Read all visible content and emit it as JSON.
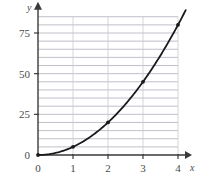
{
  "chart_data": {
    "type": "line",
    "title": "",
    "subtitle": "",
    "xlabel": "x",
    "ylabel": "y",
    "xlim": [
      0,
      4
    ],
    "ylim": [
      0,
      85
    ],
    "x_ticks": [
      0,
      1,
      2,
      3,
      4
    ],
    "x_tick_labels": [
      "0",
      "1",
      "2",
      "3",
      "4"
    ],
    "y_ticks": [
      0,
      25,
      50,
      75
    ],
    "y_tick_labels": [
      "0",
      "25",
      "50",
      "75"
    ],
    "grid": {
      "horizontal": true,
      "horizontal_step": 5,
      "horizontal_values": [
        5,
        10,
        15,
        20,
        25,
        30,
        35,
        40,
        45,
        50,
        55,
        60,
        65,
        70,
        75,
        80,
        85
      ],
      "vertical": true,
      "vertical_values": [
        1,
        2,
        3,
        4
      ]
    },
    "legend": null,
    "series": [
      {
        "name": "y = 5x²",
        "x": [
          0,
          1,
          2,
          3,
          4
        ],
        "values": [
          0,
          5,
          20,
          45,
          80
        ],
        "marked_points": [
          {
            "x": 0,
            "y": 0,
            "label": "0"
          },
          {
            "x": 1,
            "y": 5,
            "label": "5"
          },
          {
            "x": 2,
            "y": 20,
            "label": "20"
          },
          {
            "x": 3,
            "y": 45,
            "label": "45"
          },
          {
            "x": 4,
            "y": 80,
            "label": "80"
          }
        ],
        "color": "#1a1a1a",
        "line_width": 1.8,
        "marker": "dot"
      }
    ],
    "axes": {
      "x_axis_arrow": true,
      "y_axis_arrow": true,
      "axis_color": "#3a3a3a",
      "origin_label": "0"
    },
    "colors": {
      "background": "#ffffff",
      "grid_horizontal": "#b9b9c4",
      "grid_vertical": "#c9c9d4",
      "curve": "#1a1a1a",
      "text": "#4a4a4a",
      "axis": "#3a3a3a"
    }
  }
}
